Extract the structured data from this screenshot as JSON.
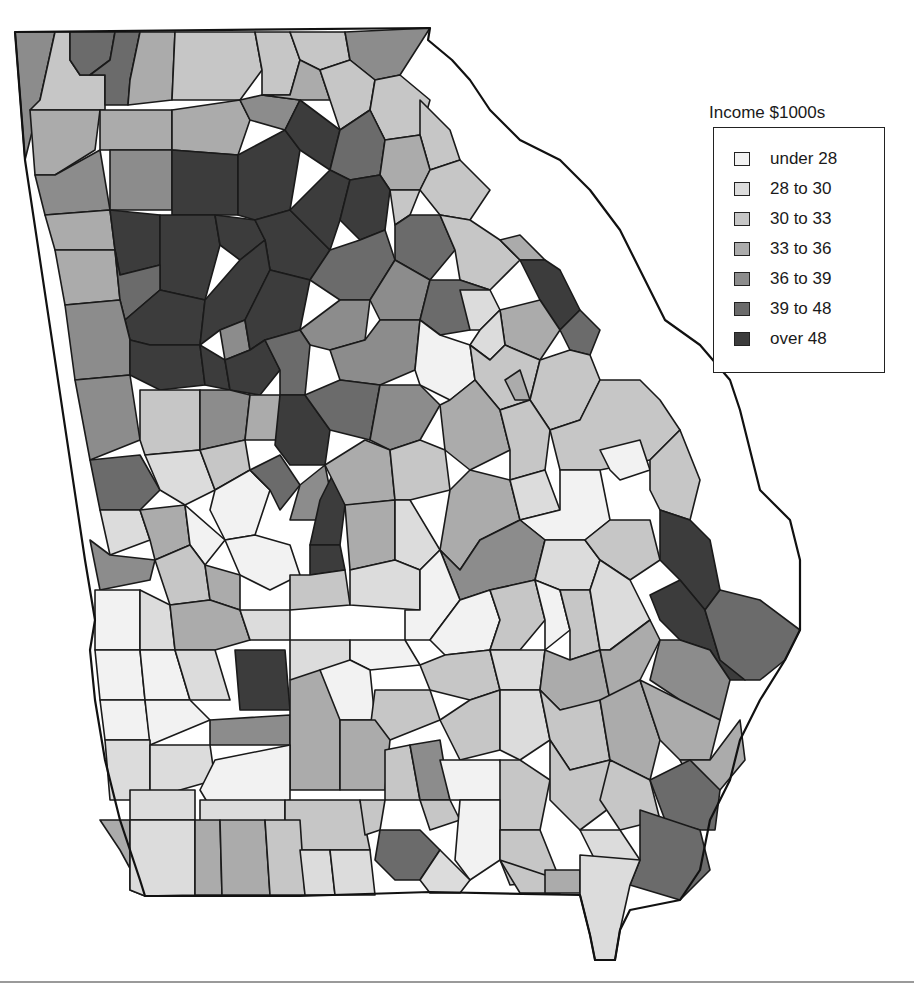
{
  "figure": {
    "type": "choropleth",
    "region": "Georgia counties"
  },
  "legend": {
    "title": "Income $1000s",
    "items": [
      {
        "label": "under 28",
        "color": "#f2f2f2"
      },
      {
        "label": "28 to 30",
        "color": "#dcdcdc"
      },
      {
        "label": "30 to 33",
        "color": "#c6c6c6"
      },
      {
        "label": "33 to 36",
        "color": "#ababab"
      },
      {
        "label": "36 to 39",
        "color": "#8c8c8c"
      },
      {
        "label": "39 to 48",
        "color": "#6b6b6b"
      },
      {
        "label": "over 48",
        "color": "#3c3c3c"
      }
    ]
  },
  "map": {
    "state_outline": "15,32 430,28 428,40 452,60 470,80 490,110 520,140 560,160 590,190 620,230 640,270 665,320 700,345 730,380 740,410 750,450 760,490 790,520 800,560 800,630 785,660 760,700 740,740 730,780 710,820 700,870 680,900 630,910 620,930 615,960 595,960 590,935 580,895 430,892 300,896 145,896 140,880 120,820 105,760 95,700 90,650 95,620 85,560 25,160",
    "counties": [
      {
        "c": 4,
        "p": "15,32 55,32 40,100 25,160"
      },
      {
        "c": 2,
        "p": "55,32 70,32 70,60 80,75 105,75 105,110 30,110 40,100"
      },
      {
        "c": 5,
        "p": "70,32 115,32 110,60 90,75 80,75 70,60"
      },
      {
        "c": 5,
        "p": "115,32 140,32 130,80 128,105 105,105 105,75 90,75 110,60"
      },
      {
        "c": 3,
        "p": "140,32 175,32 172,100 128,105 130,80"
      },
      {
        "c": 2,
        "p": "175,32 255,32 262,70 240,100 172,100"
      },
      {
        "c": 2,
        "p": "255,32 290,32 300,60 290,95 262,95 262,70"
      },
      {
        "c": 2,
        "p": "290,32 345,32 350,60 320,70 300,60"
      },
      {
        "c": 4,
        "p": "345,32 430,28 400,75 375,80 350,60"
      },
      {
        "c": 3,
        "p": "30,110 100,110 95,150 55,175 35,175"
      },
      {
        "c": 3,
        "p": "100,110 172,110 172,150 100,150"
      },
      {
        "c": 3,
        "p": "172,110 240,100 250,120 238,155 172,150"
      },
      {
        "c": 4,
        "p": "240,100 262,95 300,100 285,130 250,120"
      },
      {
        "c": 3,
        "p": "262,95 290,95 300,60 320,70 330,100 300,100"
      },
      {
        "c": 2,
        "p": "320,70 350,60 375,80 370,110 340,130 330,100"
      },
      {
        "c": 2,
        "p": "375,80 400,75 430,100 420,135 385,140 370,110"
      },
      {
        "c": 2,
        "p": "420,100 450,130 460,160 430,170 420,135"
      },
      {
        "c": 4,
        "p": "35,175 55,175 100,150 110,210 45,215"
      },
      {
        "c": 4,
        "p": "110,150 172,150 172,210 110,210"
      },
      {
        "c": 6,
        "p": "172,150 238,155 238,215 172,215"
      },
      {
        "c": 6,
        "p": "238,155 285,130 300,150 290,210 255,220 238,215"
      },
      {
        "c": 6,
        "p": "285,130 300,100 340,130 330,170 300,150"
      },
      {
        "c": 5,
        "p": "340,130 370,110 385,140 380,175 350,180 330,170"
      },
      {
        "c": 3,
        "p": "385,140 420,135 430,170 420,190 390,190 380,175"
      },
      {
        "c": 2,
        "p": "430,170 460,160 490,190 470,220 440,215 420,190"
      },
      {
        "c": 3,
        "p": "45,215 110,210 115,250 55,250"
      },
      {
        "c": 6,
        "p": "110,210 160,215 160,265 120,275 115,250"
      },
      {
        "c": 6,
        "p": "160,215 215,215 220,245 205,300 160,290 160,265"
      },
      {
        "c": 6,
        "p": "215,215 255,220 265,240 240,260 220,245"
      },
      {
        "c": 6,
        "p": "255,220 290,210 330,250 310,280 270,270 265,240"
      },
      {
        "c": 6,
        "p": "290,210 330,170 350,180 340,220 330,250"
      },
      {
        "c": 6,
        "p": "340,220 350,180 380,175 390,190 385,230 360,240"
      },
      {
        "c": 2,
        "p": "390,190 420,190 410,215 395,225"
      },
      {
        "c": 5,
        "p": "410,215 440,215 455,250 430,280 395,260 395,225"
      },
      {
        "c": 2,
        "p": "440,215 470,220 500,240 520,260 490,290 460,280 455,250"
      },
      {
        "c": 3,
        "p": "500,240 520,235 545,260 520,260"
      },
      {
        "c": 3,
        "p": "55,250 115,250 120,300 65,305"
      },
      {
        "c": 5,
        "p": "115,250 120,275 160,265 160,290 125,320 120,300"
      },
      {
        "c": 6,
        "p": "125,320 160,290 205,300 200,345 150,345 130,340"
      },
      {
        "c": 6,
        "p": "205,300 240,260 265,240 270,270 245,320 220,330 200,345"
      },
      {
        "c": 4,
        "p": "220,330 245,320 250,350 225,360"
      },
      {
        "c": 6,
        "p": "245,320 270,270 310,280 300,330 265,340 250,350"
      },
      {
        "c": 5,
        "p": "310,280 330,250 360,240 385,230 395,260 370,300 340,300"
      },
      {
        "c": 4,
        "p": "395,260 430,280 420,320 380,320 370,300"
      },
      {
        "c": 5,
        "p": "430,280 460,280 490,290 470,330 440,335 420,320"
      },
      {
        "c": 1,
        "p": "460,290 490,290 500,310 480,330 470,330"
      },
      {
        "c": 6,
        "p": "520,260 545,260 560,270 580,310 560,330 540,300"
      },
      {
        "c": 3,
        "p": "500,310 540,300 560,330 540,360 505,345"
      },
      {
        "c": 1,
        "p": "480,330 500,310 505,345 490,360 470,345"
      },
      {
        "c": 5,
        "p": "560,330 580,310 600,330 590,355 570,350"
      },
      {
        "c": 4,
        "p": "65,305 120,300 130,340 130,375 75,380"
      },
      {
        "c": 6,
        "p": "130,340 150,345 200,345 205,385 160,390 130,375"
      },
      {
        "c": 6,
        "p": "200,345 225,360 230,390 205,385"
      },
      {
        "c": 6,
        "p": "225,360 250,350 265,340 280,370 260,395 230,390"
      },
      {
        "c": 4,
        "p": "300,330 340,300 370,300 365,340 330,350 310,345"
      },
      {
        "c": 5,
        "p": "280,370 265,340 300,330 310,345 305,395 280,395"
      },
      {
        "c": 4,
        "p": "330,350 365,340 380,320 420,320 415,370 380,385 340,380"
      },
      {
        "c": 0,
        "p": "420,320 440,335 470,345 475,380 450,400 420,385 415,370"
      },
      {
        "c": 2,
        "p": "470,345 490,360 505,345 540,360 530,400 500,410 475,380"
      },
      {
        "c": 3,
        "p": "505,380 520,370 530,400 515,400"
      },
      {
        "c": 2,
        "p": "540,360 570,350 590,355 600,380 580,420 550,430 530,400"
      },
      {
        "c": 4,
        "p": "75,380 130,375 140,440 90,460"
      },
      {
        "c": 2,
        "p": "140,390 160,390 200,390 200,450 145,455 140,440"
      },
      {
        "c": 4,
        "p": "200,390 230,390 250,395 245,440 200,450"
      },
      {
        "c": 3,
        "p": "250,395 280,395 280,440 245,440"
      },
      {
        "c": 6,
        "p": "280,395 305,395 330,430 325,465 290,465 275,445"
      },
      {
        "c": 5,
        "p": "305,395 340,380 380,385 370,440 330,430"
      },
      {
        "c": 4,
        "p": "380,385 420,385 440,405 420,440 390,450 370,440"
      },
      {
        "c": 3,
        "p": "440,405 450,400 475,380 500,410 510,450 470,470 445,450"
      },
      {
        "c": 2,
        "p": "500,410 530,400 550,430 545,470 510,480 510,450"
      },
      {
        "c": 2,
        "p": "550,430 580,420 600,380 640,380 660,400 680,430 650,460 600,470 560,470"
      },
      {
        "c": 5,
        "p": "90,460 140,455 160,490 140,510 100,510"
      },
      {
        "c": 1,
        "p": "145,455 200,450 215,490 185,505 160,490"
      },
      {
        "c": 2,
        "p": "200,450 245,440 250,470 215,490"
      },
      {
        "c": 0,
        "p": "215,490 250,470 270,490 255,535 225,540 210,510"
      },
      {
        "c": 5,
        "p": "250,470 280,455 300,485 280,510 270,490"
      },
      {
        "c": 4,
        "p": "300,485 325,465 330,490 320,520 290,520"
      },
      {
        "c": 6,
        "p": "320,500 335,470 345,505 340,545 310,545"
      },
      {
        "c": 3,
        "p": "325,465 365,440 390,450 395,500 350,505 345,505"
      },
      {
        "c": 2,
        "p": "390,450 420,440 445,450 450,490 410,500 395,500"
      },
      {
        "c": 3,
        "p": "450,490 470,470 510,480 520,520 480,540 460,570 440,550"
      },
      {
        "c": 1,
        "p": "510,480 545,470 560,510 520,520"
      },
      {
        "c": 0,
        "p": "560,470 600,470 610,520 585,540 545,540 520,520 560,510"
      },
      {
        "c": 0,
        "p": "600,450 640,440 650,470 620,480 610,470"
      },
      {
        "c": 2,
        "p": "650,460 680,430 700,480 690,520 660,510 650,490"
      },
      {
        "c": 1,
        "p": "100,510 140,510 150,540 110,555"
      },
      {
        "c": 3,
        "p": "140,510 185,505 190,545 155,560 150,540"
      },
      {
        "c": 0,
        "p": "185,505 225,540 205,565 190,545"
      },
      {
        "c": 0,
        "p": "225,540 255,535 290,545 300,575 270,590 240,575"
      },
      {
        "c": 4,
        "p": "90,540 110,555 155,560 150,580 100,590"
      },
      {
        "c": 2,
        "p": "155,560 190,545 205,565 210,600 170,605"
      },
      {
        "c": 3,
        "p": "205,565 240,575 240,610 210,600"
      },
      {
        "c": 6,
        "p": "310,545 340,545 345,570 310,575"
      },
      {
        "c": 3,
        "p": "345,505 395,500 395,560 350,570"
      },
      {
        "c": 1,
        "p": "395,500 410,500 440,550 420,570 395,560"
      },
      {
        "c": 4,
        "p": "440,550 460,570 480,540 520,520 545,540 535,580 490,590 460,600"
      },
      {
        "c": 1,
        "p": "545,540 585,540 600,560 590,590 560,590 535,580"
      },
      {
        "c": 2,
        "p": "585,540 610,520 650,520 660,560 630,580 600,560"
      },
      {
        "c": 6,
        "p": "660,510 690,520 710,540 720,590 705,610 680,580 660,560"
      },
      {
        "c": 0,
        "p": "95,590 140,590 140,650 95,650"
      },
      {
        "c": 1,
        "p": "140,590 170,605 175,650 140,650"
      },
      {
        "c": 3,
        "p": "170,605 210,600 240,610 250,640 215,650 175,650"
      },
      {
        "c": 1,
        "p": "240,610 290,610 290,640 250,640"
      },
      {
        "c": 2,
        "p": "290,575 310,575 345,570 350,605 290,610"
      },
      {
        "c": 1,
        "p": "350,570 395,560 420,570 420,610 350,605"
      },
      {
        "c": 0,
        "p": "420,570 440,550 460,600 430,640 405,640 405,610 420,610"
      },
      {
        "c": 0,
        "p": "460,600 490,590 500,620 490,650 445,655 430,640"
      },
      {
        "c": 2,
        "p": "490,590 535,580 545,620 520,650 490,650 500,620"
      },
      {
        "c": 0,
        "p": "535,580 560,590 570,630 545,650 545,620"
      },
      {
        "c": 2,
        "p": "560,590 590,590 600,650 570,660 570,630"
      },
      {
        "c": 1,
        "p": "600,560 630,580 650,620 610,650 600,650 590,590"
      },
      {
        "c": 6,
        "p": "650,595 680,580 705,610 720,660 745,680 730,680 710,650 680,640 660,620"
      },
      {
        "c": 5,
        "p": "705,610 720,590 760,600 800,630 785,660 760,680 745,680 720,660"
      },
      {
        "c": 0,
        "p": "95,650 140,650 145,700 100,700"
      },
      {
        "c": 0,
        "p": "140,650 175,650 190,700 145,700"
      },
      {
        "c": 1,
        "p": "175,650 215,650 230,700 190,700"
      },
      {
        "c": 6,
        "p": "235,650 285,650 290,710 240,710"
      },
      {
        "c": 1,
        "p": "290,640 350,640 350,680 290,680"
      },
      {
        "c": 0,
        "p": "350,640 405,640 420,665 370,670 350,660"
      },
      {
        "c": 2,
        "p": "420,665 445,655 490,650 500,690 470,700 430,690"
      },
      {
        "c": 1,
        "p": "490,650 520,650 545,650 540,690 500,690"
      },
      {
        "c": 3,
        "p": "545,650 570,660 600,650 610,700 560,710 540,690"
      },
      {
        "c": 3,
        "p": "600,650 610,650 650,620 660,640 640,680 610,700"
      },
      {
        "c": 4,
        "p": "660,640 680,640 710,650 730,680 720,720 680,700 650,680"
      },
      {
        "c": 0,
        "p": "100,700 145,700 150,740 105,740"
      },
      {
        "c": 0,
        "p": "145,700 190,700 210,720 150,745"
      },
      {
        "c": 4,
        "p": "210,720 290,715 290,745 210,745"
      },
      {
        "c": 3,
        "p": "290,680 320,670 340,700 340,790 290,790"
      },
      {
        "c": 0,
        "p": "320,670 350,660 370,670 375,720 340,720"
      },
      {
        "c": 2,
        "p": "375,690 430,690 440,720 390,740 370,730"
      },
      {
        "c": 2,
        "p": "440,720 470,700 500,690 500,750 460,760"
      },
      {
        "c": 1,
        "p": "500,690 540,690 550,740 520,760 500,750"
      },
      {
        "c": 2,
        "p": "540,690 560,710 600,700 610,760 570,770 550,740"
      },
      {
        "c": 3,
        "p": "600,700 640,680 660,740 650,780 610,760"
      },
      {
        "c": 3,
        "p": "640,680 680,700 720,720 710,760 680,760 660,740"
      },
      {
        "c": 3,
        "p": "680,760 710,760 740,720 745,760 720,790 690,780"
      },
      {
        "c": 1,
        "p": "105,740 150,740 150,800 110,800"
      },
      {
        "c": 1,
        "p": "150,745 210,745 215,780 180,790 150,800"
      },
      {
        "c": 0,
        "p": "215,760 290,745 290,800 215,815 200,790"
      },
      {
        "c": 3,
        "p": "340,720 375,720 390,740 385,790 340,790"
      },
      {
        "c": 2,
        "p": "385,750 410,745 420,800 385,800"
      },
      {
        "c": 4,
        "p": "410,745 440,740 450,800 420,800"
      },
      {
        "c": 0,
        "p": "440,760 500,760 510,800 450,800"
      },
      {
        "c": 2,
        "p": "500,760 520,760 550,780 540,830 500,830"
      },
      {
        "c": 2,
        "p": "550,740 570,770 610,760 620,800 580,830 550,800"
      },
      {
        "c": 2,
        "p": "610,760 650,780 660,820 620,830 600,800"
      },
      {
        "c": 5,
        "p": "650,780 690,760 720,790 715,830 700,830 665,820"
      },
      {
        "c": 1,
        "p": "130,790 195,790 195,820 130,820"
      },
      {
        "c": 1,
        "p": "200,800 285,800 285,850 200,850"
      },
      {
        "c": 2,
        "p": "285,800 360,800 370,850 285,850"
      },
      {
        "c": 2,
        "p": "360,800 385,800 380,830 365,835"
      },
      {
        "c": 2,
        "p": "420,800 450,800 460,820 430,830"
      },
      {
        "c": 0,
        "p": "460,800 500,800 500,860 470,880 455,860"
      },
      {
        "c": 2,
        "p": "500,830 540,830 560,880 510,885 500,860"
      },
      {
        "c": 1,
        "p": "580,830 620,830 640,860 600,870"
      },
      {
        "c": 5,
        "p": "640,810 700,830 710,870 680,900 630,885 640,860"
      },
      {
        "c": 3,
        "p": "100,820 130,820 130,890 145,896 120,850"
      },
      {
        "c": 1,
        "p": "130,820 195,820 195,895 145,896 130,890"
      },
      {
        "c": 3,
        "p": "195,820 220,820 222,895 195,895"
      },
      {
        "c": 3,
        "p": "220,820 265,820 270,895 222,895"
      },
      {
        "c": 2,
        "p": "265,820 300,820 305,895 270,895"
      },
      {
        "c": 1,
        "p": "300,850 330,850 335,895 305,895"
      },
      {
        "c": 1,
        "p": "330,850 370,850 375,895 335,895"
      },
      {
        "c": 5,
        "p": "380,830 420,830 440,850 420,880 395,880 375,860"
      },
      {
        "c": 1,
        "p": "420,880 440,850 470,880 460,893 430,893"
      },
      {
        "c": 2,
        "p": "500,860 560,880 560,893 520,893"
      },
      {
        "c": 3,
        "p": "545,870 580,870 580,893 545,893"
      },
      {
        "c": 1,
        "p": "580,855 640,860 630,885 620,930 615,960 595,960 590,935 580,895"
      }
    ]
  }
}
